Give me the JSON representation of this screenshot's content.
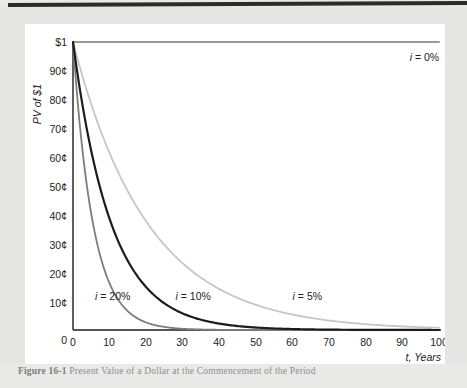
{
  "figure": {
    "caption_label": "Figure 16-1",
    "caption_text": "Present Value of a Dollar at the Commencement of the Period"
  },
  "chart_data": {
    "type": "line",
    "title": "",
    "xlabel": "t, Years",
    "ylabel": "PV of $1",
    "xlim": [
      0,
      100
    ],
    "ylim": [
      0,
      1
    ],
    "grid": false,
    "legend_position": "inline-annotations",
    "x_ticks": [
      0,
      10,
      20,
      30,
      40,
      50,
      60,
      70,
      80,
      90,
      100
    ],
    "x_tick_labels": [
      "0",
      "10",
      "20",
      "30",
      "40",
      "50",
      "60",
      "70",
      "80",
      "90",
      "100"
    ],
    "y_ticks": [
      0,
      0.1,
      0.2,
      0.3,
      0.4,
      0.5,
      0.6,
      0.7,
      0.8,
      0.9,
      1.0
    ],
    "y_tick_labels": [
      "0",
      "10¢",
      "20¢",
      "30¢",
      "40¢",
      "50¢",
      "60¢",
      "70¢",
      "80¢",
      "90¢",
      "$1"
    ],
    "x": [
      0,
      5,
      10,
      15,
      20,
      25,
      30,
      35,
      40,
      45,
      50,
      55,
      60,
      65,
      70,
      75,
      80,
      85,
      90,
      95,
      100
    ],
    "series": [
      {
        "name": "i = 0%",
        "rate": 0.0,
        "color": "#9a9a9a",
        "label": "i = 0%",
        "label_x": 92,
        "label_y": 0.935,
        "values": [
          1.0,
          1.0,
          1.0,
          1.0,
          1.0,
          1.0,
          1.0,
          1.0,
          1.0,
          1.0,
          1.0,
          1.0,
          1.0,
          1.0,
          1.0,
          1.0,
          1.0,
          1.0,
          1.0,
          1.0,
          1.0
        ]
      },
      {
        "name": "i = 5%",
        "rate": 0.05,
        "color": "#c6c6c6",
        "label": "i = 5%",
        "label_x": 60,
        "label_y": 0.105,
        "values": [
          1.0,
          0.784,
          0.614,
          0.481,
          0.377,
          0.295,
          0.231,
          0.181,
          0.142,
          0.111,
          0.087,
          0.068,
          0.054,
          0.042,
          0.033,
          0.026,
          0.02,
          0.016,
          0.012,
          0.01,
          0.008
        ]
      },
      {
        "name": "i = 10%",
        "rate": 0.1,
        "color": "#1c1c1c",
        "label": "i = 10%",
        "label_x": 28,
        "label_y": 0.105,
        "values": [
          1.0,
          0.621,
          0.386,
          0.239,
          0.149,
          0.092,
          0.057,
          0.036,
          0.022,
          0.014,
          0.0085,
          0.0053,
          0.0033,
          0.002,
          0.0013,
          0.0008,
          0.0005,
          0.0003,
          0.0002,
          0.0001,
          0.0001
        ]
      },
      {
        "name": "i = 20%",
        "rate": 0.2,
        "color": "#7d7d7d",
        "label": "i = 20%",
        "label_x": 6,
        "label_y": 0.105,
        "values": [
          1.0,
          0.402,
          0.162,
          0.065,
          0.026,
          0.0105,
          0.0042,
          0.0017,
          0.0007,
          0.0003,
          0.0001,
          0.0,
          0.0,
          0.0,
          0.0,
          0.0,
          0.0,
          0.0,
          0.0,
          0.0,
          0.0
        ]
      }
    ]
  }
}
